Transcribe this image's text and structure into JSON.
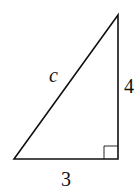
{
  "diagram": {
    "type": "right-triangle",
    "labels": {
      "hypotenuse": "c",
      "vertical_leg": "4",
      "horizontal_leg": "3"
    },
    "right_angle_marker": true,
    "colors": {
      "stroke": "#111111",
      "background": "#ffffff"
    }
  }
}
